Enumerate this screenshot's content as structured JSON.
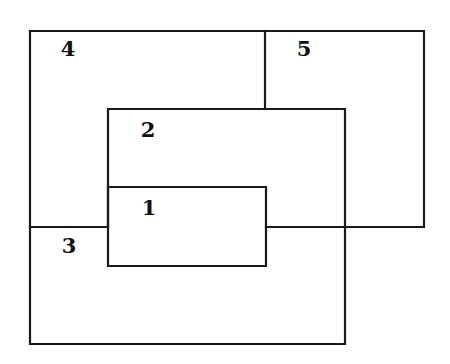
{
  "diagram": {
    "type": "overlapping-regions",
    "line_color": "#1a1a1a",
    "background": "#ffffff",
    "regions": [
      {
        "id": "1",
        "label": "1",
        "label_pos": {
          "x": 149,
          "y": 207
        }
      },
      {
        "id": "2",
        "label": "2",
        "label_pos": {
          "x": 148,
          "y": 128
        }
      },
      {
        "id": "3",
        "label": "3",
        "label_pos": {
          "x": 69,
          "y": 245
        }
      },
      {
        "id": "4",
        "label": "4",
        "label_pos": {
          "x": 68,
          "y": 48
        }
      },
      {
        "id": "5",
        "label": "5",
        "label_pos": {
          "x": 304,
          "y": 48
        }
      }
    ]
  }
}
